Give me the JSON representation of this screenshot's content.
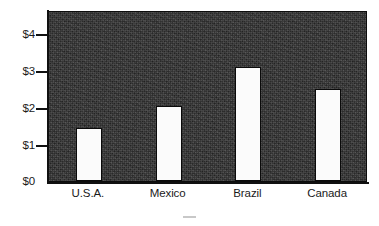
{
  "chart_data": {
    "type": "bar",
    "title": "",
    "subtitle": "",
    "xlabel": "",
    "ylabel": "",
    "categories": [
      "U.S.A.",
      "Mexico",
      "Brazil",
      "Canada"
    ],
    "values": [
      1.45,
      2.05,
      3.1,
      2.5
    ],
    "series": [
      {
        "name": "",
        "values": [
          1.45,
          2.05,
          3.1,
          2.5
        ]
      }
    ],
    "ylim": [
      0,
      4.65
    ],
    "y_ticks": [
      0,
      1,
      2,
      3,
      4
    ],
    "y_tick_labels": [
      "$0",
      "$1",
      "$2",
      "$3",
      "$4"
    ],
    "x_tick_labels": [
      "U.S.A.",
      "Mexico",
      "Brazil",
      "Canada"
    ],
    "grid": false,
    "legend": null,
    "legend_position": "none",
    "annotations": [],
    "colors": {
      "plot_background": "#2e2e2e",
      "bar_fill": "#fbfbfb",
      "bar_edge": "#0a0a0a",
      "axis": "#101010",
      "text": "#1a1a1a",
      "page_background": "#ffffff"
    }
  },
  "axis": {
    "y_labels": [
      "$4",
      "$3",
      "$2",
      "$1",
      "$0"
    ]
  }
}
